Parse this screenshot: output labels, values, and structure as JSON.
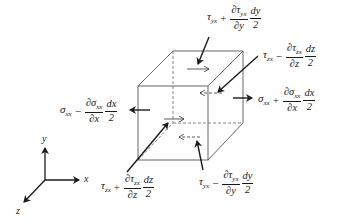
{
  "diagram": {
    "axes": {
      "x_label": "x",
      "y_label": "y",
      "z_label": "z"
    },
    "labels": {
      "top": {
        "base": "τ",
        "base_sub": "yx",
        "op": "+",
        "d_num": "∂τ",
        "d_num_sub": "yx",
        "d_den": "∂y",
        "f_num": "dy",
        "f_den": "2"
      },
      "back_right": {
        "base": "τ",
        "base_sub": "zx",
        "op": "−",
        "d_num": "∂τ",
        "d_num_sub": "zx",
        "d_den": "∂z",
        "f_num": "dz",
        "f_den": "2"
      },
      "left": {
        "base": "σ",
        "base_sub": "xx",
        "op": "−",
        "d_num": "∂σ",
        "d_num_sub": "xx",
        "d_den": "∂x",
        "f_num": "dx",
        "f_den": "2"
      },
      "right": {
        "base": "σ",
        "base_sub": "xx",
        "op": "+",
        "d_num": "∂σ",
        "d_num_sub": "xx",
        "d_den": "∂x",
        "f_num": "dx",
        "f_den": "2"
      },
      "front": {
        "base": "τ",
        "base_sub": "zx",
        "op": "+",
        "d_num": "∂τ",
        "d_num_sub": "zx",
        "d_den": "∂z",
        "f_num": "dz",
        "f_den": "2"
      },
      "bottom": {
        "base": "τ",
        "base_sub": "yx",
        "op": "−",
        "d_num": "∂τ",
        "d_num_sub": "yx",
        "d_den": "∂y",
        "f_num": "dy",
        "f_den": "2"
      }
    },
    "colors": {
      "line": "#1a1a1a",
      "cube_edge": "#555555",
      "hidden_edge": "#777777"
    }
  }
}
